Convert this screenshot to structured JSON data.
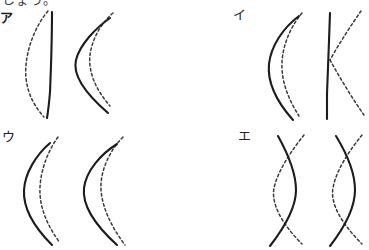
{
  "page": {
    "background_color": "#ffffff",
    "truncated_header_text": "しょう。",
    "solid_curve_color": "#1c1c1c",
    "dashed_curve_color": "#3a3a3a"
  },
  "options": [
    {
      "label": "ア",
      "figures": [
        {
          "name": "figure-a-left",
          "solid_description": "near-vertical straight line",
          "dashed_description": "curve bulging to the left"
        },
        {
          "name": "figure-a-right",
          "solid_description": "curve bulging to the left with sharp apex",
          "dashed_description": "curve bulging to the left, inside the solid curve"
        }
      ]
    },
    {
      "label": "イ",
      "figures": [
        {
          "name": "figure-i-left",
          "solid_description": "curve bulging to the left",
          "dashed_description": "curve bulging to the left, inside the solid curve"
        },
        {
          "name": "figure-i-right",
          "solid_description": "near-vertical straight line",
          "dashed_description": "chevron opening to the right"
        }
      ]
    },
    {
      "label": "ウ",
      "figures": [
        {
          "name": "figure-u-left",
          "solid_description": "curve bulging to the left",
          "dashed_description": "curve bulging to the left, inside the solid curve"
        },
        {
          "name": "figure-u-right",
          "solid_description": "deeper curve bulging to the left",
          "dashed_description": "curve bulging to the left, inside the solid curve"
        }
      ]
    },
    {
      "label": "エ",
      "figures": [
        {
          "name": "figure-e-left",
          "solid_description": "S-shaped curve",
          "dashed_description": "arc crossing the S-shaped solid curve"
        },
        {
          "name": "figure-e-right",
          "solid_description": "S-shaped curve",
          "dashed_description": "arc crossing the S-shaped solid curve"
        }
      ]
    }
  ]
}
